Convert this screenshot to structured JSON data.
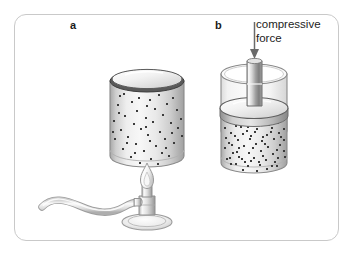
{
  "figure": {
    "type": "science-diagram",
    "panels": [
      {
        "id": "a",
        "label": "a",
        "description": "sealed cylinder of gas heated by a bunsen burner",
        "elements": [
          "gas-cylinder",
          "gas-particles",
          "bunsen-burner",
          "flame",
          "rubber-hose",
          "burner-base"
        ]
      },
      {
        "id": "b",
        "label": "b",
        "description": "cylinder of gas compressed by a piston",
        "elements": [
          "gas-cylinder",
          "piston-rod",
          "piston-disk",
          "gas-particles",
          "force-arrow"
        ]
      }
    ],
    "annotation": {
      "force_label_line1": "compressive",
      "force_label_line2": "force",
      "arrow_direction": "down"
    },
    "colors": {
      "frame_border": "#c9c9c9",
      "text": "#1c1c1c",
      "label": "#1a1a1a",
      "glass_outline": "#8c8c8c",
      "rim_dark": "#4a4a4a",
      "particle": "#3a3a3a",
      "metal_light": "#f0f0f0",
      "metal_mid": "#9a9a9a",
      "metal_dark": "#6b6b6b",
      "background": "#ffffff"
    }
  },
  "panel_a": {
    "label": "a",
    "cylinder": {
      "name": "gas-cylinder-a",
      "particle_count": 52,
      "particle_density": "low"
    },
    "burner": {
      "name": "bunsen-burner",
      "flame": "lit",
      "hose": "s-curve"
    }
  },
  "panel_b": {
    "label": "b",
    "cylinder": {
      "name": "gas-cylinder-b",
      "particle_count": 78,
      "particle_density": "high"
    },
    "piston": {
      "name": "piston",
      "state": "pressed-down"
    },
    "force_arrow": {
      "name": "compressive-force-arrow",
      "direction": "down"
    },
    "caption_line1": "compressive",
    "caption_line2": "force"
  }
}
